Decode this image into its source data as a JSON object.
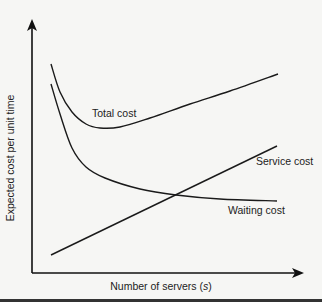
{
  "chart_data": {
    "type": "line",
    "title": "",
    "xlabel": "Number of servers (s)",
    "xlabel_parts": {
      "prefix": "Number of servers (",
      "var": "s",
      "suffix": ")"
    },
    "ylabel": "Expected cost per unit time",
    "grid": false,
    "ticks": false,
    "legend": "inline labels",
    "x_range_px": [
      32,
      303
    ],
    "y_range_px": [
      20,
      273
    ],
    "series": [
      {
        "name": "Total cost",
        "label_pos": [
          92,
          114
        ],
        "shape": "U-shaped: decreases steeply, minimum near middle-left, then rises roughly linearly",
        "points_px": [
          [
            51,
            64
          ],
          [
            60,
            92
          ],
          [
            72,
            112
          ],
          [
            86,
            124
          ],
          [
            100,
            128
          ],
          [
            120,
            127
          ],
          [
            150,
            118
          ],
          [
            190,
            104
          ],
          [
            230,
            91
          ],
          [
            278,
            74
          ]
        ]
      },
      {
        "name": "Service cost",
        "label_pos": [
          256,
          162
        ],
        "shape": "linear increasing",
        "points_px": [
          [
            51,
            255
          ],
          [
            277,
            146
          ]
        ]
      },
      {
        "name": "Waiting cost",
        "label_pos": [
          228,
          211
        ],
        "shape": "convex decreasing, leveling off",
        "points_px": [
          [
            51,
            84
          ],
          [
            60,
            114
          ],
          [
            72,
            148
          ],
          [
            86,
            167
          ],
          [
            105,
            178
          ],
          [
            140,
            189
          ],
          [
            176,
            195
          ],
          [
            220,
            199
          ],
          [
            277,
            201
          ]
        ]
      }
    ]
  }
}
